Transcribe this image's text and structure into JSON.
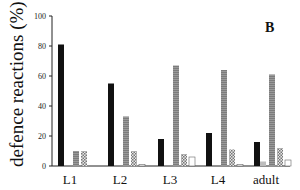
{
  "panel_label": "B",
  "chart_data": {
    "type": "bar",
    "title": "",
    "xlabel": "",
    "ylabel": "defence reactions (%)",
    "ylim": [
      0,
      100
    ],
    "yticks": [
      0,
      20,
      40,
      60,
      80,
      100
    ],
    "grid": false,
    "legend": null,
    "categories": [
      "L1",
      "L2",
      "L3",
      "L4",
      "adult"
    ],
    "series": [
      {
        "name": "black",
        "fill": "#111111",
        "values": [
          81,
          55,
          18,
          22,
          16
        ]
      },
      {
        "name": "light-gray",
        "fill": "#b8b8b8",
        "values": [
          0,
          0,
          0,
          0,
          3
        ]
      },
      {
        "name": "gray-striped",
        "fill": "#8c8c8c",
        "values": [
          10,
          33,
          67,
          64,
          61
        ]
      },
      {
        "name": "checkered",
        "fill": "#cfcfcf",
        "values": [
          10,
          10,
          8,
          11,
          12
        ]
      },
      {
        "name": "white",
        "fill": "#ffffff",
        "values": [
          0,
          1,
          6,
          1,
          4
        ]
      }
    ]
  }
}
